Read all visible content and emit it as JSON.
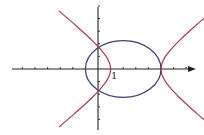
{
  "figure": {
    "x_tick_label": "1",
    "colors": {
      "axis": "#222222",
      "ellipse": "#3d3f7a",
      "hyperbola": "#a63a52",
      "background": "#ffffff"
    },
    "axes": {
      "origin_px": [
        98,
        69
      ],
      "unit_px": 12.6,
      "x_ticks": [
        -7,
        -6,
        -5,
        -4,
        -3,
        -2,
        -1,
        1,
        2,
        3,
        4,
        5,
        6,
        7
      ],
      "y_ticks": [
        -5,
        -4,
        -3,
        -2,
        -1,
        1,
        2,
        3,
        4,
        5
      ]
    },
    "curves": [
      {
        "name": "ellipse",
        "center": [
          2,
          0
        ],
        "semi_x": 3,
        "semi_y": 2.25
      },
      {
        "name": "hyperbola",
        "center": [
          3,
          0
        ],
        "a": 2,
        "opens": "horizontal"
      }
    ]
  }
}
